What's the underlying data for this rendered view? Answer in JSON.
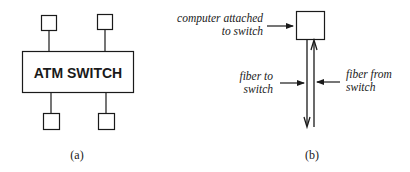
{
  "panel_a": {
    "switch_label": "ATM SWITCH",
    "caption": "(a)",
    "computers": [
      {
        "position": "top-left"
      },
      {
        "position": "top-right"
      },
      {
        "position": "bottom-left"
      },
      {
        "position": "bottom-right"
      }
    ]
  },
  "panel_b": {
    "caption": "(b)",
    "labels": {
      "computer_line1": "computer attached",
      "computer_line2": "to switch",
      "fiber_to_line1": "fiber to",
      "fiber_to_line2": "switch",
      "fiber_from_line1": "fiber from",
      "fiber_from_line2": "switch"
    }
  },
  "colors": {
    "stroke": "#1a1a1a",
    "text": "#1a1a1a",
    "background": "#ffffff"
  }
}
